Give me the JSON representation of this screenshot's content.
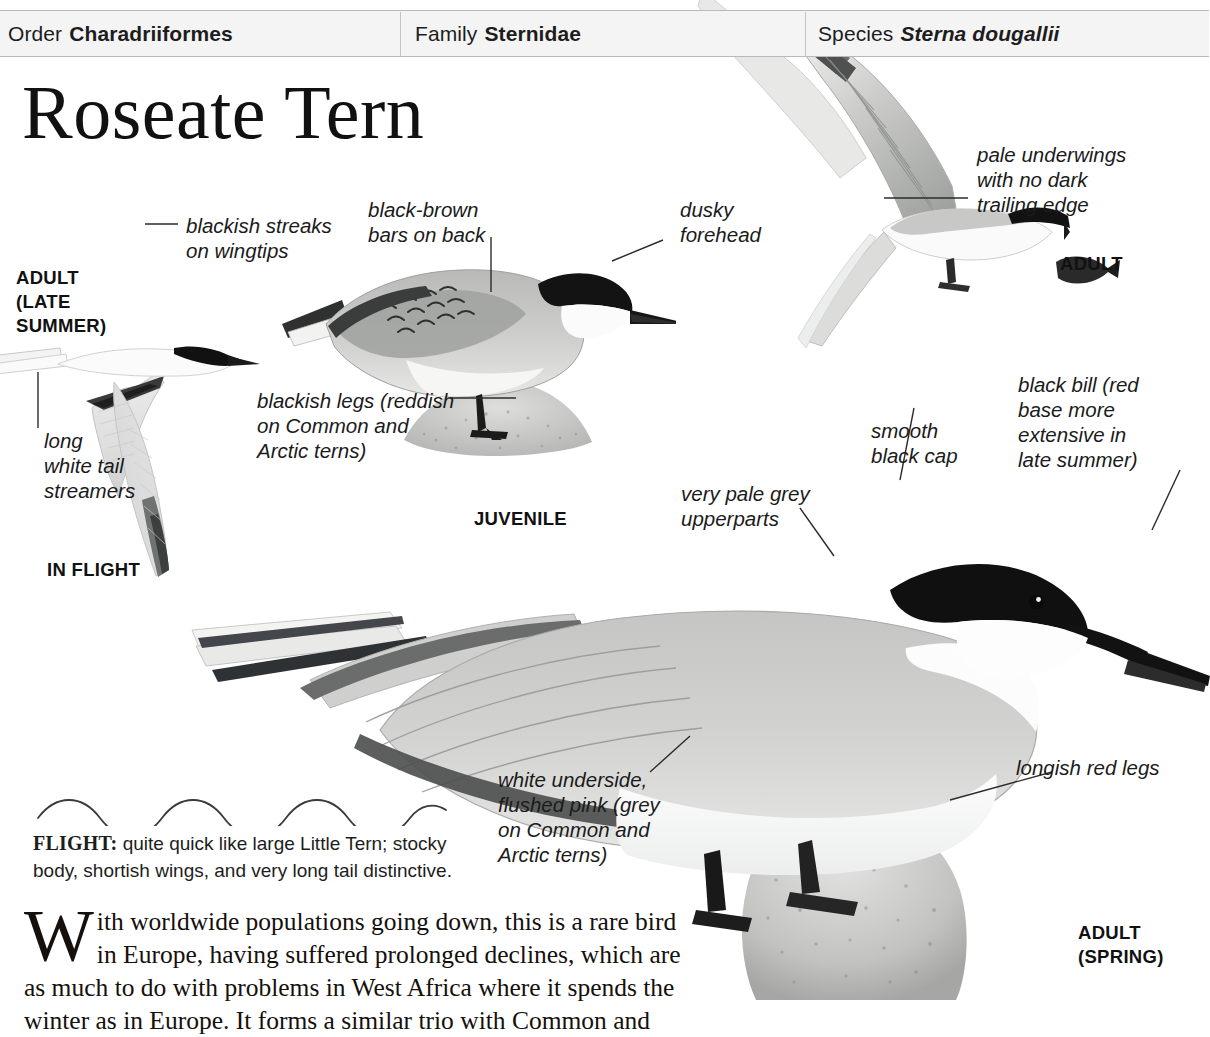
{
  "taxonomy": {
    "order_label": "Order",
    "order_value": "Charadriiformes",
    "family_label": "Family",
    "family_value": "Sternidae",
    "species_label": "Species",
    "species_value": "Sterna dougallii"
  },
  "title": "Roseate Tern",
  "annotations": {
    "wingtips": "blackish streaks\non wingtips",
    "bars_on_back": "black-brown\nbars on back",
    "dusky_forehead": "dusky\nforehead",
    "pale_underwings": "pale underwings\nwith no dark\ntrailing edge",
    "blackish_legs": "blackish legs (reddish\non Common and\n Arctic terns)",
    "long_white_tail": "long\nwhite tail\nstreamers",
    "black_bill": "black bill (red\nbase more\nextensive in\nlate summer)",
    "smooth_black_cap": "smooth\nblack cap",
    "very_pale_grey": "very pale grey\nupperparts",
    "white_underside": "white underside,\nflushed pink (grey\non Common and\nArctic terns)",
    "longish_red_legs": "longish red legs"
  },
  "plate_labels": {
    "adult_late_summer": "ADULT\n(LATE\nSUMMER)",
    "in_flight": "IN FLIGHT",
    "juvenile": "JUVENILE",
    "adult": "ADULT",
    "adult_spring": "ADULT\n(SPRING)"
  },
  "flight": {
    "heading": "FLIGHT:",
    "text": " quite quick like large Little Tern; stocky body, shortish wings, and very long tail distinctive."
  },
  "body": {
    "dropcap": "W",
    "text": "ith worldwide populations going down, this is a rare bird in Europe, having suffered prolonged declines, which are as much to do with problems in West Africa where it spends the winter as in Europe. It forms a similar trio with Common and"
  },
  "colors": {
    "bar_bg": "#f4f4f4",
    "bar_border": "#b9b9b9",
    "ink": "#1a1a1a",
    "cap_black": "#141414",
    "pale_grey": "#d9dad9",
    "mid_grey": "#a7a9a8",
    "rock": "#bdbdbd"
  }
}
